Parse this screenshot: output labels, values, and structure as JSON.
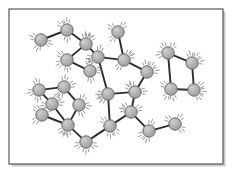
{
  "figure": {
    "caption": "",
    "background_color": "#ffffff",
    "frame": {
      "name": "figure-border",
      "x": 9,
      "y": 9,
      "width": 214,
      "height": 155,
      "stroke_color": "#4a4a4a",
      "stroke_width": 1.1,
      "fill_color": "#ffffff",
      "shadow_color": "#c9c9c9"
    },
    "style": {
      "node_fill": "#a8a8a8",
      "node_fill_light": "#c2c2c2",
      "node_stroke": "#6b6b6b",
      "node_stroke_width": 1.0,
      "node_radius": 6.2,
      "bond_color": "#2e2e2e",
      "bond_width": 1.9,
      "vibration_color": "#8c8c8c",
      "vibration_width": 0.9
    }
  },
  "chart_data": {
    "type": "scatter",
    "xlabel": "",
    "ylabel": "",
    "xlim": [
      9,
      223
    ],
    "ylim": [
      9,
      164
    ],
    "grid": false,
    "legend": "none",
    "node_count": 26,
    "bond_count": 28,
    "nodes": [
      {
        "id": 0,
        "label": "n0",
        "x": 41,
        "y": 40
      },
      {
        "id": 1,
        "label": "n1",
        "x": 67,
        "y": 30
      },
      {
        "id": 2,
        "label": "n2",
        "x": 86,
        "y": 44
      },
      {
        "id": 3,
        "label": "n3",
        "x": 67,
        "y": 60
      },
      {
        "id": 4,
        "label": "n4",
        "x": 90,
        "y": 71
      },
      {
        "id": 5,
        "label": "n5",
        "x": 118,
        "y": 32
      },
      {
        "id": 6,
        "label": "n6",
        "x": 124,
        "y": 60
      },
      {
        "id": 7,
        "label": "n7",
        "x": 147,
        "y": 72
      },
      {
        "id": 8,
        "label": "n8",
        "x": 168,
        "y": 53
      },
      {
        "id": 9,
        "label": "n9",
        "x": 192,
        "y": 63
      },
      {
        "id": 10,
        "label": "n10",
        "x": 171,
        "y": 89
      },
      {
        "id": 11,
        "label": "n11",
        "x": 194,
        "y": 90
      },
      {
        "id": 12,
        "label": "n12",
        "x": 39,
        "y": 90
      },
      {
        "id": 13,
        "label": "n13",
        "x": 64,
        "y": 87
      },
      {
        "id": 14,
        "label": "n14",
        "x": 79,
        "y": 105
      },
      {
        "id": 15,
        "label": "n15",
        "x": 42,
        "y": 115
      },
      {
        "id": 16,
        "label": "n16",
        "x": 68,
        "y": 125
      },
      {
        "id": 17,
        "label": "n17",
        "x": 86,
        "y": 142
      },
      {
        "id": 18,
        "label": "n18",
        "x": 108,
        "y": 94
      },
      {
        "id": 19,
        "label": "n19",
        "x": 110,
        "y": 126
      },
      {
        "id": 20,
        "label": "n20",
        "x": 131,
        "y": 112
      },
      {
        "id": 21,
        "label": "n21",
        "x": 135,
        "y": 92
      },
      {
        "id": 22,
        "label": "n22",
        "x": 149,
        "y": 131
      },
      {
        "id": 23,
        "label": "n23",
        "x": 175,
        "y": 124
      },
      {
        "id": 24,
        "label": "n24",
        "x": 98,
        "y": 57
      },
      {
        "id": 25,
        "label": "n25",
        "x": 52,
        "y": 104
      }
    ],
    "bonds": [
      {
        "from": 0,
        "to": 1
      },
      {
        "from": 1,
        "to": 2
      },
      {
        "from": 2,
        "to": 3
      },
      {
        "from": 3,
        "to": 4
      },
      {
        "from": 2,
        "to": 24
      },
      {
        "from": 5,
        "to": 6
      },
      {
        "from": 6,
        "to": 7
      },
      {
        "from": 6,
        "to": 24
      },
      {
        "from": 7,
        "to": 21
      },
      {
        "from": 8,
        "to": 9
      },
      {
        "from": 8,
        "to": 10
      },
      {
        "from": 9,
        "to": 11
      },
      {
        "from": 10,
        "to": 11
      },
      {
        "from": 12,
        "to": 13
      },
      {
        "from": 13,
        "to": 14
      },
      {
        "from": 14,
        "to": 16
      },
      {
        "from": 15,
        "to": 16
      },
      {
        "from": 16,
        "to": 17
      },
      {
        "from": 17,
        "to": 19
      },
      {
        "from": 18,
        "to": 19
      },
      {
        "from": 18,
        "to": 21
      },
      {
        "from": 18,
        "to": 24
      },
      {
        "from": 19,
        "to": 20
      },
      {
        "from": 20,
        "to": 21
      },
      {
        "from": 20,
        "to": 22
      },
      {
        "from": 22,
        "to": 23
      },
      {
        "from": 12,
        "to": 25
      },
      {
        "from": 25,
        "to": 16
      }
    ],
    "vibration_marks": {
      "description": "Short curved tick strokes radiating from each particle indicating thermal vibration",
      "strokes_per_node": 3,
      "inner_offset": 7.5,
      "length": 3.4
    }
  }
}
